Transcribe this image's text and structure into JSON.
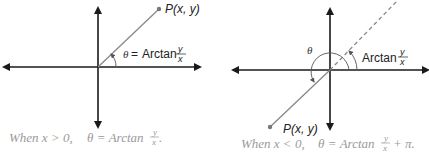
{
  "left_diagram": {
    "point_label": "P(x, y)",
    "theta_symbol": "θ",
    "equals": "=",
    "arctan_label": "Arctan",
    "frac_num": "y",
    "frac_den": "x",
    "caption_prefix": "When x > 0,",
    "caption_theta": "θ = Arctan",
    "caption_num": "y",
    "caption_den": "x",
    "caption_suffix": "."
  },
  "right_diagram": {
    "point_label": "P(x, y)",
    "theta_symbol": "θ",
    "arctan_label": "Arctan",
    "frac_num": "y",
    "frac_den": "x",
    "caption_prefix": "When x < 0,",
    "caption_theta": "θ = Arctan",
    "caption_num": "y",
    "caption_den": "x",
    "caption_suffix": "+ π."
  },
  "colors": {
    "axis": "#1a1a1a",
    "ray": "#888888",
    "caption": "#9a9a9a"
  }
}
